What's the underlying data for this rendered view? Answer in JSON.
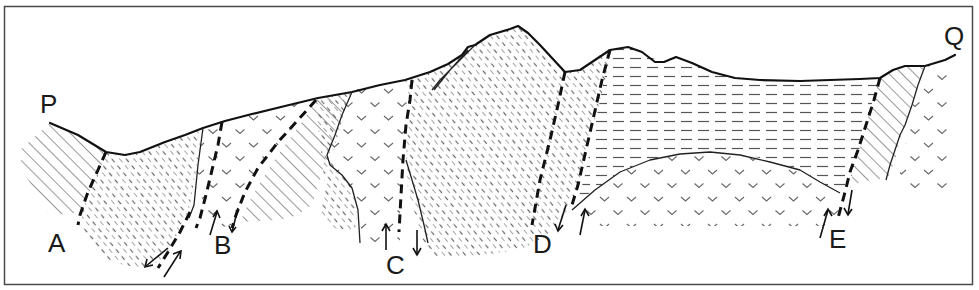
{
  "figure": {
    "type": "geological-cross-section",
    "section_endpoints": {
      "start": "P",
      "end": "Q"
    },
    "faults": [
      {
        "id": "A",
        "label": "A",
        "motion": "paired arrows, opposite sense"
      },
      {
        "id": "B",
        "label": "B",
        "motion": "up on left, down on right"
      },
      {
        "id": "C",
        "label": "C",
        "motion": "up on left, down on right"
      },
      {
        "id": "D",
        "label": "D",
        "motion": "down on left, up on right"
      },
      {
        "id": "E",
        "label": "E",
        "motion": "up on left, down on right"
      }
    ],
    "units": [
      {
        "id": "diagonal-hatch",
        "pattern": "diagonal solid lines"
      },
      {
        "id": "dashed-diagonal",
        "pattern": "short diagonal dashes"
      },
      {
        "id": "horizontal-dash",
        "pattern": "horizontal dashes"
      },
      {
        "id": "v-pattern",
        "pattern": "v symbols"
      }
    ],
    "colors": {
      "ink": "#111111",
      "frame": "#4a4a4a",
      "background": "#ffffff"
    }
  },
  "labels": {
    "P": "P",
    "Q": "Q",
    "A": "A",
    "B": "B",
    "C": "C",
    "D": "D",
    "E": "E"
  }
}
